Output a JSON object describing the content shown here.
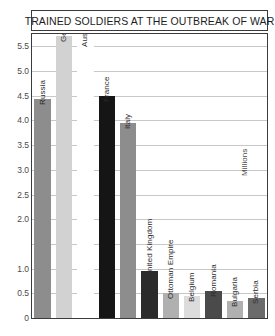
{
  "chart_data": {
    "type": "bar",
    "title": "TRAINED SOLDIERS AT THE OUTBREAK OF WAR",
    "xlabel": "",
    "ylabel": "Millions",
    "ylim": [
      0,
      5.75
    ],
    "grid": true,
    "legend": "none",
    "categories": [
      "Russia",
      "Germany",
      "Austria-Hungary",
      "France",
      "Italy",
      "United Kingdom",
      "Ottoman Empire",
      "Belgium",
      "Romania",
      "Bulgaria",
      "Serbia"
    ],
    "values": [
      4.43,
      5.7,
      5.6,
      4.5,
      3.95,
      0.95,
      0.5,
      0.45,
      0.55,
      0.35,
      0.4
    ],
    "bar_colors": [
      "#8d8d8d",
      "#d2d2d2",
      "#fdfdfd",
      "#151515",
      "#8d8d8d",
      "#2b2b2b",
      "#b0b0b0",
      "#dcdcdc",
      "#4a4a4a",
      "#b0b0b0",
      "#6b6b6b"
    ],
    "yticks": [
      {
        "value": 5.5,
        "label": "5.5"
      },
      {
        "value": 5.0,
        "label": "5.0"
      },
      {
        "value": 4.5,
        "label": "4.5"
      },
      {
        "value": 4.0,
        "label": "4.0"
      },
      {
        "value": 3.5,
        "label": "3.5"
      },
      {
        "value": 3.0,
        "label": "3.0"
      },
      {
        "value": 2.5,
        "label": "2.5"
      },
      {
        "value": 2.0,
        "label": "2.0"
      },
      {
        "value": 1.5,
        "label": ""
      },
      {
        "value": 1.0,
        "label": "1.0"
      },
      {
        "value": 0.5,
        "label": "0.5"
      },
      {
        "value": 0.0,
        "label": "0"
      }
    ]
  },
  "style": {
    "frame_color": "#3b3b3b",
    "grid_color": "#c8c8c8",
    "background": "#ffffff",
    "text_color": "#1d1d1d",
    "tick_text_color": "#4a4a4a"
  }
}
